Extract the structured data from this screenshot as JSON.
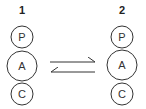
{
  "diagram": {
    "states": [
      {
        "label": "1",
        "circles": [
          {
            "text": "P",
            "cx": 22,
            "cy": 37,
            "r": 11
          },
          {
            "text": "A",
            "cx": 22,
            "cy": 66,
            "r": 15
          },
          {
            "text": "C",
            "cx": 22,
            "cy": 94,
            "r": 11
          }
        ]
      },
      {
        "label": "2",
        "circles": [
          {
            "text": "P",
            "cx": 122,
            "cy": 37,
            "r": 11
          },
          {
            "text": "A",
            "cx": 122,
            "cy": 65,
            "r": 15
          },
          {
            "text": "C",
            "cx": 122,
            "cy": 94,
            "r": 11
          }
        ]
      }
    ],
    "arrows": [
      {
        "direction": "right",
        "from": 1,
        "to": 2
      },
      {
        "direction": "left",
        "from": 2,
        "to": 1
      }
    ],
    "colors": {
      "stroke": "#333333",
      "background": "#ffffff"
    }
  }
}
